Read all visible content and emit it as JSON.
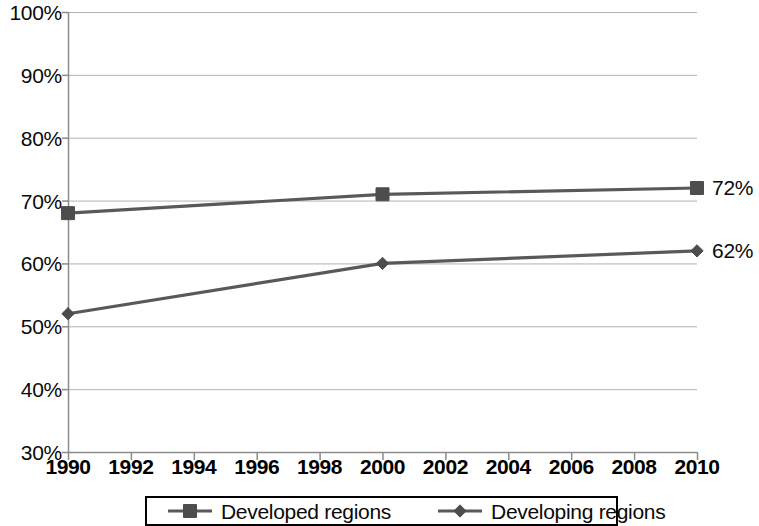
{
  "chart_data": {
    "type": "line",
    "title": "",
    "subtitle": "",
    "xlabel": "",
    "ylabel": "",
    "x": [
      1990,
      2000,
      2010
    ],
    "xlim": [
      1990,
      2010
    ],
    "ylim": [
      30,
      100
    ],
    "grid": true,
    "y_unit": "%",
    "legend_position": "bottom",
    "series": [
      {
        "name": "Developed regions",
        "marker": "square",
        "color": "#595959",
        "values": [
          68,
          71,
          72
        ],
        "end_label": "72%"
      },
      {
        "name": "Developing regions",
        "marker": "diamond",
        "color": "#595959",
        "values": [
          52,
          60,
          62
        ],
        "end_label": "62%"
      }
    ],
    "yticks": [
      {
        "value": 100,
        "label": "100%"
      },
      {
        "value": 90,
        "label": "90%"
      },
      {
        "value": 80,
        "label": "80%"
      },
      {
        "value": 70,
        "label": "70%"
      },
      {
        "value": 60,
        "label": "60%"
      },
      {
        "value": 50,
        "label": "50%"
      },
      {
        "value": 40,
        "label": "40%"
      },
      {
        "value": 30,
        "label": "30%"
      }
    ],
    "xticks": [
      {
        "value": 1990,
        "label": "1990"
      },
      {
        "value": 1992,
        "label": "1992"
      },
      {
        "value": 1994,
        "label": "1994"
      },
      {
        "value": 1996,
        "label": "1996"
      },
      {
        "value": 1998,
        "label": "1998"
      },
      {
        "value": 2000,
        "label": "2000"
      },
      {
        "value": 2002,
        "label": "2002"
      },
      {
        "value": 2004,
        "label": "2004"
      },
      {
        "value": 2006,
        "label": "2006"
      },
      {
        "value": 2008,
        "label": "2008"
      },
      {
        "value": 2010,
        "label": "2010"
      }
    ],
    "annotations": [
      {
        "text": "72%",
        "series": "Developed regions",
        "x": 2010,
        "y": 72
      },
      {
        "text": "62%",
        "series": "Developing regions",
        "x": 2010,
        "y": 62
      }
    ]
  },
  "legend": {
    "entries": [
      {
        "label": "Developed regions",
        "marker": "square"
      },
      {
        "label": "Developing regions",
        "marker": "diamond"
      }
    ]
  },
  "colors": {
    "line": "#595959",
    "marker": "#4d4d4d",
    "grid": "#b3b3b3",
    "axis": "#8c8c8c",
    "text": "#0a0a0a"
  }
}
